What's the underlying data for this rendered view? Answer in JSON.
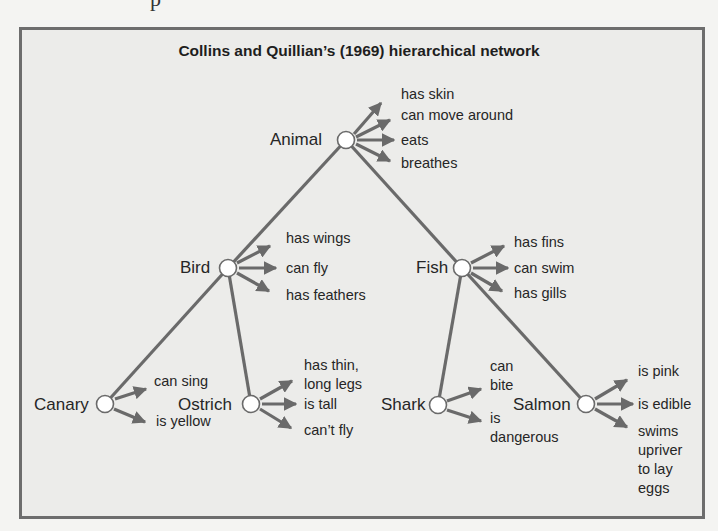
{
  "page": {
    "fragment_text": "p"
  },
  "figure": {
    "title": "Collins and Quillian’s (1969) hierarchical network",
    "colors": {
      "border": "#6d6d6d",
      "background": "#ececea",
      "edge": "#6a6a6a",
      "node_fill": "#ffffff",
      "text": "#262626"
    },
    "nodes": {
      "animal": {
        "label": "Animal",
        "x": 346,
        "y": 140
      },
      "bird": {
        "label": "Bird",
        "x": 228,
        "y": 268
      },
      "fish": {
        "label": "Fish",
        "x": 462,
        "y": 268
      },
      "canary": {
        "label": "Canary",
        "x": 105,
        "y": 404
      },
      "ostrich": {
        "label": "Ostrich",
        "x": 251,
        "y": 404
      },
      "shark": {
        "label": "Shark",
        "x": 438,
        "y": 405
      },
      "salmon": {
        "label": "Salmon",
        "x": 586,
        "y": 404
      }
    },
    "edges": [
      {
        "from": "animal",
        "to": "bird"
      },
      {
        "from": "animal",
        "to": "fish"
      },
      {
        "from": "bird",
        "to": "canary"
      },
      {
        "from": "bird",
        "to": "ostrich"
      },
      {
        "from": "fish",
        "to": "shark"
      },
      {
        "from": "fish",
        "to": "salmon"
      }
    ],
    "properties": {
      "animal": [
        "has skin",
        "can move around",
        "eats",
        "breathes"
      ],
      "bird": [
        "has wings",
        "can fly",
        "has feathers"
      ],
      "fish": [
        "has fins",
        "can swim",
        "has gills"
      ],
      "canary": [
        "can sing",
        "is yellow"
      ],
      "ostrich": [
        "has thin,\nlong legs",
        "is tall",
        "can’t fly"
      ],
      "shark": [
        "can\nbite",
        "is\ndangerous"
      ],
      "salmon": [
        "is pink",
        "is edible",
        "swims\nupriver\nto lay\neggs"
      ]
    }
  }
}
